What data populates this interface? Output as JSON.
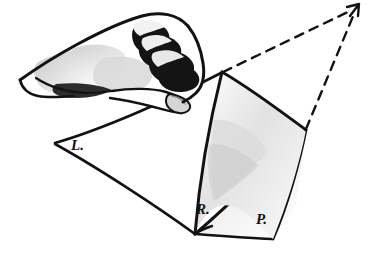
{
  "figure": {
    "background_color": "#ffffff",
    "ink_color": "#111111",
    "shadow_color": "#b9b9b9",
    "width": 373,
    "height": 263
  },
  "labels": {
    "left_page": "L.",
    "recto_page": "R.",
    "verso_page": "P."
  },
  "label_positions": {
    "left_page": {
      "x": 71,
      "y": 150
    },
    "recto_page": {
      "x": 196,
      "y": 214
    },
    "verso_page": {
      "x": 256,
      "y": 224
    }
  },
  "vanishing_point": {
    "label": "vanishing-point-arrow",
    "x": 358,
    "y": 5
  },
  "dashed_lines": [
    {
      "name": "fold-top-to-vanishing-point",
      "x1": 223,
      "y1": 72,
      "x2": 352,
      "y2": 10
    },
    {
      "name": "right-corner-to-vanishing-point",
      "x1": 306,
      "y1": 129,
      "x2": 354,
      "y2": 13
    }
  ],
  "geometry": {
    "left_page": {
      "name": "left-flat-page",
      "points": "55,143 222,72 262,105 195,235"
    },
    "verso_page": {
      "name": "verso-flat-page-P",
      "points": "196,234 306,130 272,239"
    },
    "lifted_page": {
      "name": "lifted-curved-page-R",
      "top": "222,72",
      "bottom": "195,235",
      "right_top": "306,130",
      "right_bottom": "272,239"
    }
  },
  "hand": {
    "name": "hand-lifting-page",
    "wrist_start": {
      "x": 20,
      "y": 80
    },
    "fingertip": {
      "x": 188,
      "y": 101
    }
  }
}
